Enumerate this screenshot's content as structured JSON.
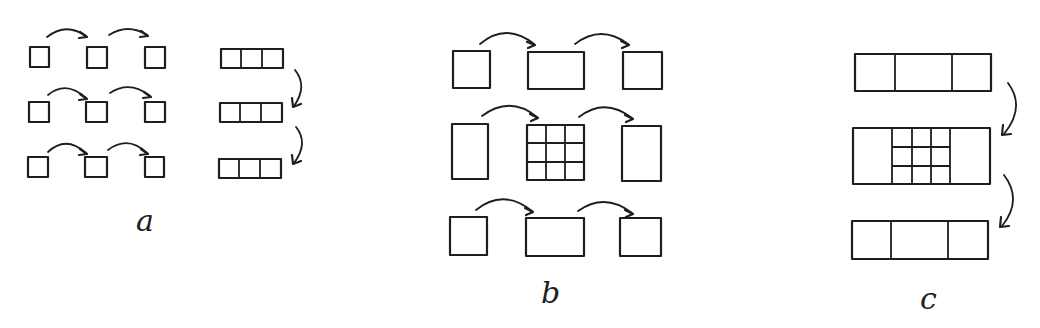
{
  "diagram": {
    "stroke_color": "#1e1e1e",
    "background": "#ffffff",
    "panels": [
      {
        "label": "a",
        "left_group": "3 rows x 3 small squares, arrows pointing right between consecutive squares",
        "right_group": "3 strips of 3 cells, arrows pointing down between consecutive strips"
      },
      {
        "label": "b",
        "layout": "3 rows x 3 blocks; center block subdivided into 3x3 grid; arrows pointing right between blocks in each row"
      },
      {
        "label": "c",
        "layout": "3 horizontal strips of 3 cells each; middle strip's center cell subdivided into 3x3 grid; arrows pointing down between strips"
      }
    ]
  }
}
